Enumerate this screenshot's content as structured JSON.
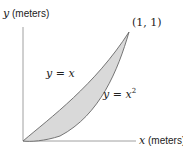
{
  "diagram": {
    "y_axis": {
      "var": "y",
      "unit": "(meters)"
    },
    "x_axis": {
      "var": "x",
      "unit": "(meters)"
    },
    "point_label": "(1, 1)",
    "curves": [
      {
        "label": "y = x",
        "var_left": "y",
        "eq": " = x"
      },
      {
        "label": "y = x²",
        "var_left": "y",
        "eq": " = x",
        "sup": "2"
      }
    ],
    "colors": {
      "fill": "#d9d9d9",
      "stroke": "#555555",
      "axis": "#777777"
    }
  }
}
